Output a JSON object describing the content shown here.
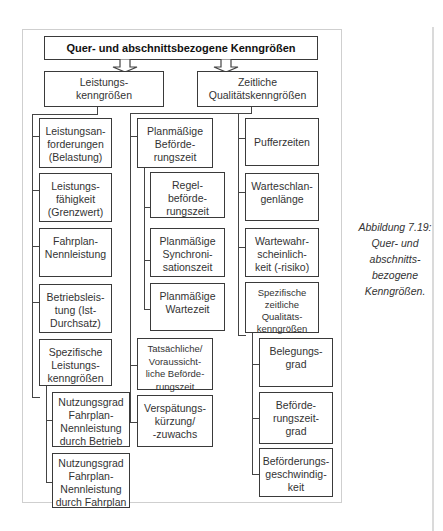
{
  "diagram": {
    "root": "Quer- und abschnittsbezogene Kenngrößen",
    "branches": {
      "left": "Leistungs-\nkenngrößen",
      "right": "Zeitliche\nQualitätskenngrößen"
    },
    "col1": [
      "Leistungsan-\nforderungen\n(Belastung)",
      "Leistungs-\nfähigkeit\n(Grenzwert)",
      "Fahrplan-\nNennleistung",
      "Betriebsleis-\ntung (Ist-\nDurchsatz)",
      "Spezifische\nLeistungs-\nkenngrößen"
    ],
    "col1_sub": [
      "Nutzungsgrad\nFahrplan-\nNennleistung\ndurch Betrieb",
      "Nutzungsgrad\nFahrplan-\nNennleistung\ndurch Fahrplan"
    ],
    "col2": [
      "Planmäßige\nBeförde-\nrungszeit",
      "Tatsächliche/\nVoraussicht-\nliche Beförde-\nrungszeit",
      "Verspätungs-\nkürzung/\n-zuwachs"
    ],
    "col2_sub": [
      "Regel-\nbeförde-\nrungszeit",
      "Planmäßige\nSynchroni-\nsationszeit",
      "Planmäßige\nWartezeit"
    ],
    "col3": [
      "Pufferzeiten",
      "Warteschlan-\ngenlänge",
      "Wartewahr-\nscheinlich-\nkeit (-risiko)",
      "Spezifische\nzeitliche\nQualitäts-\nkenngrößen"
    ],
    "col3_sub": [
      "Belegungs-\ngrad",
      "Beförde-\nrungszeit-\ngrad",
      "Beförderungs-\ngeschwindig-\nkeit"
    ]
  },
  "caption": "Abbildung 7.19:\nQuer- und\nabschnitts-\nbezogene\nKenngrößen."
}
